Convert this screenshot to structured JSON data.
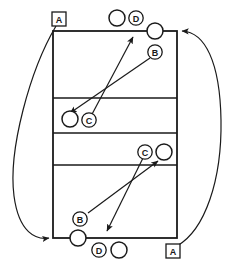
{
  "diagram": {
    "type": "sports-court-play-diagram",
    "colors": {
      "line": "#1a1a1a",
      "fill": "#ffffff",
      "background": "#ffffff"
    },
    "court": {
      "name": "volleyball-court",
      "left": 53,
      "top": 31,
      "right": 177,
      "bottom": 238,
      "center_line_y": 133,
      "attack_line_top_y": 98,
      "attack_line_bottom_y": 165
    },
    "labels": [
      {
        "id": "a-top-left",
        "text": "A",
        "shape": "square",
        "x": 59,
        "y": 19
      },
      {
        "id": "d-top",
        "text": "D",
        "shape": "circle",
        "x": 136,
        "y": 18
      },
      {
        "id": "b-top",
        "text": "B",
        "shape": "circle",
        "x": 155,
        "y": 52
      },
      {
        "id": "c-upper",
        "text": "C",
        "shape": "circle",
        "x": 89,
        "y": 120
      },
      {
        "id": "c-lower",
        "text": "C",
        "shape": "circle",
        "x": 145,
        "y": 152
      },
      {
        "id": "b-bottom",
        "text": "B",
        "shape": "circle",
        "x": 80,
        "y": 219
      },
      {
        "id": "d-bottom",
        "text": "D",
        "shape": "circle",
        "x": 99,
        "y": 250
      },
      {
        "id": "a-bottom-right",
        "text": "A",
        "shape": "square",
        "x": 173,
        "y": 251
      }
    ],
    "players": [
      {
        "id": "player-top-left",
        "x": 117,
        "y": 18,
        "r": 8
      },
      {
        "id": "player-top-right",
        "x": 155,
        "y": 31,
        "r": 8
      },
      {
        "id": "player-mid-left",
        "x": 70,
        "y": 119,
        "r": 8
      },
      {
        "id": "player-mid-right",
        "x": 164,
        "y": 152,
        "r": 8
      },
      {
        "id": "player-bottom-left",
        "x": 78,
        "y": 238,
        "r": 8
      },
      {
        "id": "player-bottom-mid",
        "x": 119,
        "y": 250,
        "r": 8
      }
    ],
    "arrows": [
      {
        "id": "arrow-upper-to-net",
        "from_x": 90,
        "from_y": 120,
        "to_x": 132,
        "to_y": 36
      },
      {
        "id": "arrow-b-top-to-mid",
        "from_x": 150,
        "from_y": 57,
        "to_x": 70,
        "to_y": 113
      },
      {
        "id": "arrow-b-bottom-to-net",
        "from_x": 87,
        "from_y": 214,
        "to_x": 158,
        "to_y": 160
      },
      {
        "id": "arrow-c-lower-to-back",
        "from_x": 143,
        "from_y": 158,
        "to_x": 106,
        "to_y": 232
      }
    ],
    "curves": [
      {
        "id": "left-return-path",
        "description": "curve from top-left A marker around the left side to bottom-left court corner",
        "start_x": 56,
        "start_y": 26,
        "end_x": 53,
        "end_y": 238
      },
      {
        "id": "right-return-path",
        "description": "curve from bottom-right A marker around the right side to top-right court corner",
        "start_x": 176,
        "start_y": 244,
        "end_x": 177,
        "end_y": 31
      }
    ],
    "icon_names": {
      "player": "player-circle-icon",
      "label_circle": "role-label-circle-icon",
      "label_square": "role-label-square-icon",
      "arrow": "movement-arrow-icon",
      "curve": "rotation-path-curve-icon"
    }
  }
}
